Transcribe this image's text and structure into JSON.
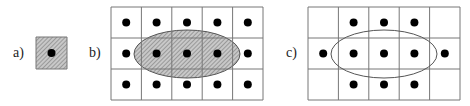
{
  "colors": {
    "background": "#ffffff",
    "line": "#777777",
    "dot": "#000000",
    "hatch_fill": "#c8c8c8",
    "hatch_stroke": "#6a6a6a",
    "ellipse_outline": "#555555"
  },
  "panels": [
    {
      "id": "a",
      "label": "a)",
      "label_pos": {
        "x": 13,
        "y": 46
      },
      "grid": {
        "x": 36,
        "y": 37,
        "cols": 1,
        "rows": 1,
        "cell_w": 31,
        "cell_h": 32
      },
      "cell_hatched": true,
      "dots": [
        [
          0,
          0
        ]
      ],
      "ellipse": null
    },
    {
      "id": "b",
      "label": "b)",
      "label_pos": {
        "x": 89,
        "y": 46
      },
      "grid": {
        "x": 111,
        "y": 7,
        "cols": 5,
        "rows": 3,
        "cell_w": 30.4,
        "cell_h": 31
      },
      "cell_hatched": false,
      "dots": [
        [
          0,
          0
        ],
        [
          1,
          0
        ],
        [
          2,
          0
        ],
        [
          3,
          0
        ],
        [
          4,
          0
        ],
        [
          0,
          1
        ],
        [
          1,
          1
        ],
        [
          2,
          1
        ],
        [
          3,
          1
        ],
        [
          4,
          1
        ],
        [
          0,
          2
        ],
        [
          1,
          2
        ],
        [
          2,
          2
        ],
        [
          3,
          2
        ],
        [
          4,
          2
        ]
      ],
      "ellipse": {
        "cx": 187,
        "cy": 54,
        "rx": 53,
        "ry": 24,
        "hatched": true
      }
    },
    {
      "id": "c",
      "label": "c)",
      "label_pos": {
        "x": 286,
        "y": 46
      },
      "grid": {
        "x": 308,
        "y": 7,
        "cols": 5,
        "rows": 3,
        "cell_w": 30.4,
        "cell_h": 31
      },
      "cell_hatched": false,
      "dots": [
        [
          1,
          0
        ],
        [
          2,
          0
        ],
        [
          3,
          0
        ],
        [
          0,
          1
        ],
        [
          1,
          1
        ],
        [
          2,
          1
        ],
        [
          3,
          1
        ],
        [
          4,
          1
        ],
        [
          1,
          2
        ],
        [
          2,
          2
        ],
        [
          3,
          2
        ]
      ],
      "ellipse": {
        "cx": 384,
        "cy": 54,
        "rx": 53,
        "ry": 24,
        "hatched": false
      }
    }
  ],
  "dot_radius": 4
}
